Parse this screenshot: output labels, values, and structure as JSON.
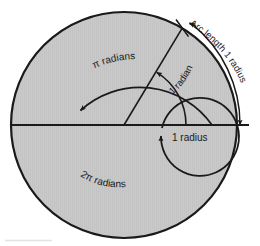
{
  "figure": {
    "colors": {
      "disk_fill": "#c9c9c9",
      "stroke": "#1a1a1a",
      "background": "#ffffff",
      "footer_rule": "#e2e2e2"
    },
    "geometry": {
      "center_x": 124,
      "center_y": 125,
      "outer_radius": 113,
      "pi_arc_radius": 88,
      "radian_arc_radius": 62,
      "two_pi_arc_radius": 39,
      "radius_line_angle_degrees": 59,
      "arc_length_offset": 15
    },
    "labels": {
      "arc_length": "Arc length 1 radius",
      "one_radian": "1 radian",
      "pi_radians": "π radians",
      "two_pi_radians": "2π radians",
      "one_radius": "1 radius"
    }
  }
}
